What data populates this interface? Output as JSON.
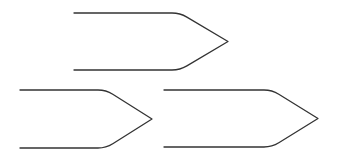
{
  "canvas": {
    "width": 341,
    "height": 160,
    "background": "#ffffff"
  },
  "stroke_color": "#333333",
  "shapes": [
    {
      "name": "pentagon-arrow-top",
      "left": 74,
      "top": 13,
      "bottom": 70,
      "corner_x": 180,
      "tip_x": 228,
      "radius": 8
    },
    {
      "name": "pentagon-arrow-bottom-left",
      "left": 20,
      "top": 90,
      "bottom": 148,
      "corner_x": 106,
      "tip_x": 152,
      "radius": 8
    },
    {
      "name": "pentagon-arrow-bottom-right",
      "left": 164,
      "top": 90,
      "bottom": 147,
      "corner_x": 272,
      "tip_x": 318,
      "radius": 8
    }
  ]
}
